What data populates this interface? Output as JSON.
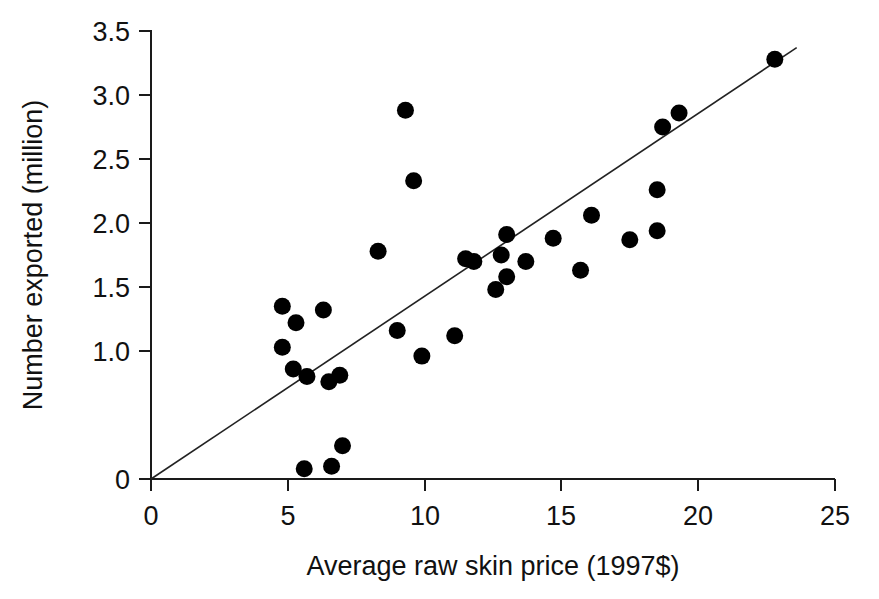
{
  "chart_data": {
    "type": "scatter",
    "title": "",
    "xlabel": "Average raw skin price (1997$)",
    "ylabel": "Number exported (million)",
    "xlim": [
      0,
      25
    ],
    "ylim": [
      0,
      3.5
    ],
    "xticks": [
      "0",
      "5",
      "10",
      "15",
      "20",
      "25"
    ],
    "xtick_values": [
      0,
      5,
      10,
      15,
      20,
      25
    ],
    "yticks": [
      "0",
      "1.0",
      "1.5",
      "2.0",
      "2.5",
      "3.0",
      "3.5"
    ],
    "ytick_values": [
      0,
      1.0,
      1.5,
      2.0,
      2.5,
      3.0,
      3.5
    ],
    "grid": false,
    "legend": "none",
    "marker": "filled-circle",
    "marker_color": "#000000",
    "points": [
      {
        "x": 4.8,
        "y": 1.03
      },
      {
        "x": 4.8,
        "y": 1.35
      },
      {
        "x": 5.3,
        "y": 1.22
      },
      {
        "x": 5.2,
        "y": 0.86
      },
      {
        "x": 5.7,
        "y": 0.8
      },
      {
        "x": 5.6,
        "y": 0.08
      },
      {
        "x": 6.3,
        "y": 1.32
      },
      {
        "x": 6.5,
        "y": 0.76
      },
      {
        "x": 6.6,
        "y": 0.1
      },
      {
        "x": 6.9,
        "y": 0.81
      },
      {
        "x": 7.0,
        "y": 0.26
      },
      {
        "x": 8.3,
        "y": 1.78
      },
      {
        "x": 9.3,
        "y": 2.88
      },
      {
        "x": 9.6,
        "y": 2.33
      },
      {
        "x": 9.0,
        "y": 1.16
      },
      {
        "x": 9.9,
        "y": 0.96
      },
      {
        "x": 11.1,
        "y": 1.12
      },
      {
        "x": 11.5,
        "y": 1.72
      },
      {
        "x": 11.8,
        "y": 1.7
      },
      {
        "x": 12.8,
        "y": 1.75
      },
      {
        "x": 12.6,
        "y": 1.48
      },
      {
        "x": 13.0,
        "y": 1.91
      },
      {
        "x": 13.0,
        "y": 1.58
      },
      {
        "x": 13.7,
        "y": 1.7
      },
      {
        "x": 14.7,
        "y": 1.88
      },
      {
        "x": 15.7,
        "y": 1.63
      },
      {
        "x": 16.1,
        "y": 2.06
      },
      {
        "x": 17.5,
        "y": 1.87
      },
      {
        "x": 18.5,
        "y": 2.26
      },
      {
        "x": 18.5,
        "y": 1.94
      },
      {
        "x": 18.7,
        "y": 2.75
      },
      {
        "x": 19.3,
        "y": 2.86
      },
      {
        "x": 22.8,
        "y": 3.28
      }
    ],
    "fit_line": {
      "type": "linear-regression",
      "x_start": 0,
      "y_start": 0,
      "x_end": 23.6,
      "y_end": 3.37
    }
  }
}
